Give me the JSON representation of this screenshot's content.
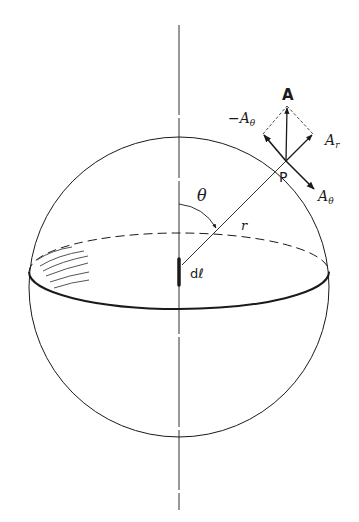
{
  "figure": {
    "labels": {
      "vector": "A",
      "neg_theta_comp": "−A",
      "neg_theta_sub": "θ",
      "radial_comp": "A",
      "radial_sub": "r",
      "theta_comp": "A",
      "theta_sub": "θ",
      "point": "P",
      "angle": "θ",
      "radius": "r",
      "element": "dℓ"
    },
    "colors": {
      "ink": "#1a1a1a",
      "background": "#ffffff",
      "hatch": "#555555"
    }
  }
}
